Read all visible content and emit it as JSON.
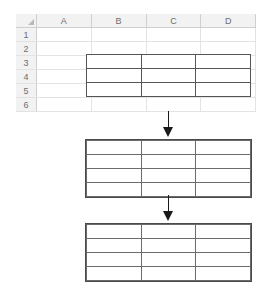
{
  "diagram": {
    "flow_direction": "top-to-bottom",
    "step_count": 3,
    "arrow_count": 2
  },
  "spreadsheet": {
    "name": "worksheet-grid",
    "corner_icon": "select-all-triangle-icon",
    "column_headers": [
      "A",
      "B",
      "C",
      "D"
    ],
    "row_headers": [
      "1",
      "2",
      "3",
      "4",
      "5",
      "6"
    ],
    "column_count": 4,
    "row_count": 6,
    "header_fill": "#f2f2f2",
    "gridline_color": "#e3e3e3",
    "cell_fill": "#ffffff"
  },
  "embedded_table": {
    "name": "embedded-table-step-1",
    "columns": 3,
    "rows": 3,
    "spans_columns": [
      "B",
      "C",
      "D"
    ],
    "spans_rows": [
      "3",
      "4",
      "5"
    ],
    "border_color": "#555555",
    "cells": [
      [
        "",
        "",
        ""
      ],
      [
        "",
        "",
        ""
      ],
      [
        "",
        "",
        ""
      ]
    ]
  },
  "tables": [
    {
      "name": "data-table-step-2",
      "columns": 3,
      "rows": 4,
      "border_color": "#6b6b6b",
      "outline_color": "#4a4a4a",
      "cells": [
        [
          "",
          "",
          ""
        ],
        [
          "",
          "",
          ""
        ],
        [
          "",
          "",
          ""
        ],
        [
          "",
          "",
          ""
        ]
      ]
    },
    {
      "name": "data-table-step-3",
      "columns": 3,
      "rows": 4,
      "border_color": "#6b6b6b",
      "outline_color": "#4a4a4a",
      "cells": [
        [
          "",
          "",
          ""
        ],
        [
          "",
          "",
          ""
        ],
        [
          "",
          "",
          ""
        ],
        [
          "",
          "",
          ""
        ]
      ]
    }
  ],
  "arrows": [
    {
      "name": "flow-arrow-1",
      "direction": "down",
      "color": "#1a1a1a"
    },
    {
      "name": "flow-arrow-2",
      "direction": "down",
      "color": "#1a1a1a"
    }
  ]
}
